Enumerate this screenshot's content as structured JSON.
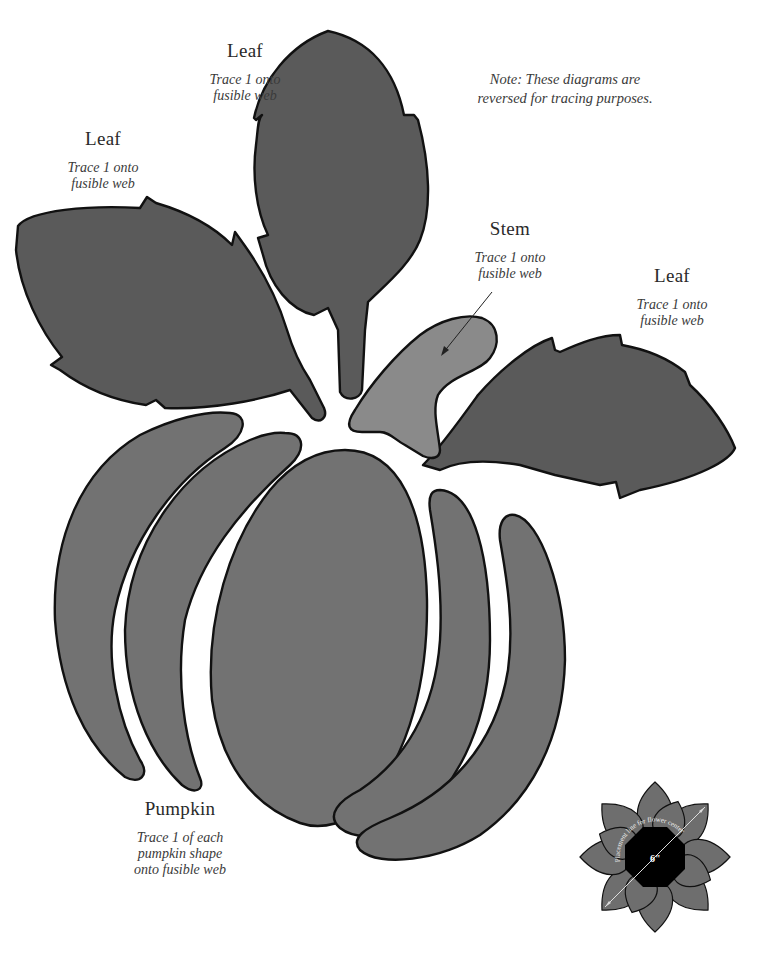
{
  "note": {
    "line1": "Note: These diagrams are",
    "line2": "reversed for tracing purposes."
  },
  "labels": {
    "leaf_top": {
      "title": "Leaf",
      "line1": "Trace 1 onto",
      "line2": "fusible web"
    },
    "leaf_left": {
      "title": "Leaf",
      "line1": "Trace 1 onto",
      "line2": "fusible web"
    },
    "stem": {
      "title": "Stem",
      "line1": "Trace 1 onto",
      "line2": "fusible web"
    },
    "leaf_right": {
      "title": "Leaf",
      "line1": "Trace 1 onto",
      "line2": "fusible web"
    },
    "pumpkin": {
      "title": "Pumpkin",
      "line1": "Trace 1 of each",
      "line2": "pumpkin shape",
      "line3": "onto fusible web"
    }
  },
  "flower_diagram": {
    "curve_text": "Placement line for flower center",
    "dimension": "6\""
  },
  "colors": {
    "leaf": "#5a5a5a",
    "pumpkin": "#727272",
    "stem": "#8a8a8a",
    "flower_petal": "#6e6e6e",
    "flower_center": "#000000",
    "outline": "#111111"
  }
}
